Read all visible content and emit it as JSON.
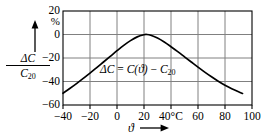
{
  "chart_data": {
    "type": "line",
    "title": "",
    "xlabel": "ϑ",
    "ylabel": "ΔC / C20",
    "y_unit": "%",
    "x_unit": "°C",
    "xlim": [
      -40,
      100
    ],
    "ylim": [
      -60,
      20
    ],
    "grid": true,
    "legend": null,
    "annotation": {
      "delta_c": "ΔC",
      "equals": "=",
      "c_of_theta": "C(ϑ)",
      "minus": "−",
      "c20_symbol": "C",
      "c20_sub": "20"
    },
    "xticks": [
      {
        "value": -40,
        "label": "−40"
      },
      {
        "value": -20,
        "label": "−20"
      },
      {
        "value": 0,
        "label": "0"
      },
      {
        "value": 20,
        "label": "20"
      },
      {
        "value": 40,
        "label": "40°C"
      },
      {
        "value": 60,
        "label": "60"
      },
      {
        "value": 80,
        "label": "80"
      },
      {
        "value": 100,
        "label": "100"
      }
    ],
    "yticks": [
      {
        "value": 20,
        "label": "20"
      },
      {
        "value": 0,
        "label": "0"
      },
      {
        "value": -20,
        "label": "−20"
      },
      {
        "value": -40,
        "label": "−40"
      },
      {
        "value": -60,
        "label": "−60"
      }
    ],
    "series": [
      {
        "name": "relative capacitance change",
        "points": [
          [
            -40,
            -50.0
          ],
          [
            -35,
            -46.0
          ],
          [
            -30,
            -41.8
          ],
          [
            -25,
            -37.4
          ],
          [
            -20,
            -32.8
          ],
          [
            -15,
            -28.2
          ],
          [
            -10,
            -23.4
          ],
          [
            -5,
            -18.6
          ],
          [
            0,
            -13.8
          ],
          [
            5,
            -9.2
          ],
          [
            10,
            -5.2
          ],
          [
            15,
            -2.0
          ],
          [
            20,
            -0.2
          ],
          [
            22,
            0.0
          ],
          [
            25,
            -0.6
          ],
          [
            30,
            -3.0
          ],
          [
            35,
            -6.4
          ],
          [
            40,
            -10.4
          ],
          [
            45,
            -14.6
          ],
          [
            50,
            -19.0
          ],
          [
            55,
            -23.4
          ],
          [
            60,
            -27.8
          ],
          [
            65,
            -32.0
          ],
          [
            70,
            -36.0
          ],
          [
            75,
            -39.8
          ],
          [
            80,
            -43.2
          ],
          [
            85,
            -46.2
          ],
          [
            90,
            -48.8
          ],
          [
            93,
            -50.2
          ]
        ]
      }
    ]
  },
  "axis_labels": {
    "y_numerator_delta": "ΔC",
    "y_denominator_symbol": "C",
    "y_denominator_sub": "20",
    "x_symbol": "ϑ"
  },
  "colors": {
    "curve": "#000000",
    "grid": "#808080",
    "border": "#000000",
    "background": "#ffffff",
    "text": "#000000"
  }
}
